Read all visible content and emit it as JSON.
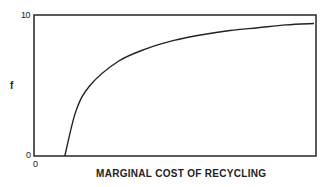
{
  "chart_data": {
    "type": "line",
    "title": "",
    "xlabel": "MARGINAL COST OF RECYCLING",
    "ylabel": "f",
    "ylim": [
      0,
      10
    ],
    "y_ticks": [
      "0",
      "10"
    ],
    "x_ticks": [
      "0"
    ],
    "grid": false,
    "legend": null,
    "series": [
      {
        "name": "f",
        "x": [
          0.11,
          0.15,
          0.2,
          0.3,
          0.4,
          0.5,
          0.6,
          0.7,
          0.8,
          0.9,
          1.0
        ],
        "values": [
          0,
          3.2,
          5.0,
          6.7,
          7.6,
          8.2,
          8.6,
          8.9,
          9.1,
          9.3,
          9.4
        ]
      }
    ]
  },
  "labels": {
    "y_top": "10",
    "y_bottom": "0",
    "x_origin": "0",
    "y_axis": "f",
    "x_axis": "MARGINAL COST OF RECYCLING"
  },
  "colors": {
    "line": "#222222",
    "frame": "#333333"
  }
}
